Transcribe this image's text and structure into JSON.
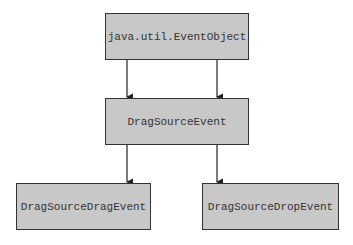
{
  "diagram": {
    "type": "class-hierarchy",
    "nodes": [
      {
        "id": "eventobject",
        "label": "java.util.EventObject"
      },
      {
        "id": "dragsourceevent",
        "label": "DragSourceEvent"
      },
      {
        "id": "dragsourcedragevent",
        "label": "DragSourceDragEvent"
      },
      {
        "id": "dragsourcedropevent",
        "label": "DragSourceDropEvent"
      }
    ],
    "edges": [
      {
        "from": "eventobject",
        "to": "dragsourceevent"
      },
      {
        "from": "eventobject",
        "to": "dragsourceevent"
      },
      {
        "from": "dragsourceevent",
        "to": "dragsourcedragevent"
      },
      {
        "from": "dragsourceevent",
        "to": "dragsourcedropevent"
      }
    ],
    "colors": {
      "box_fill": "#c8c8c8",
      "box_border": "#333333",
      "line": "#222222"
    }
  }
}
